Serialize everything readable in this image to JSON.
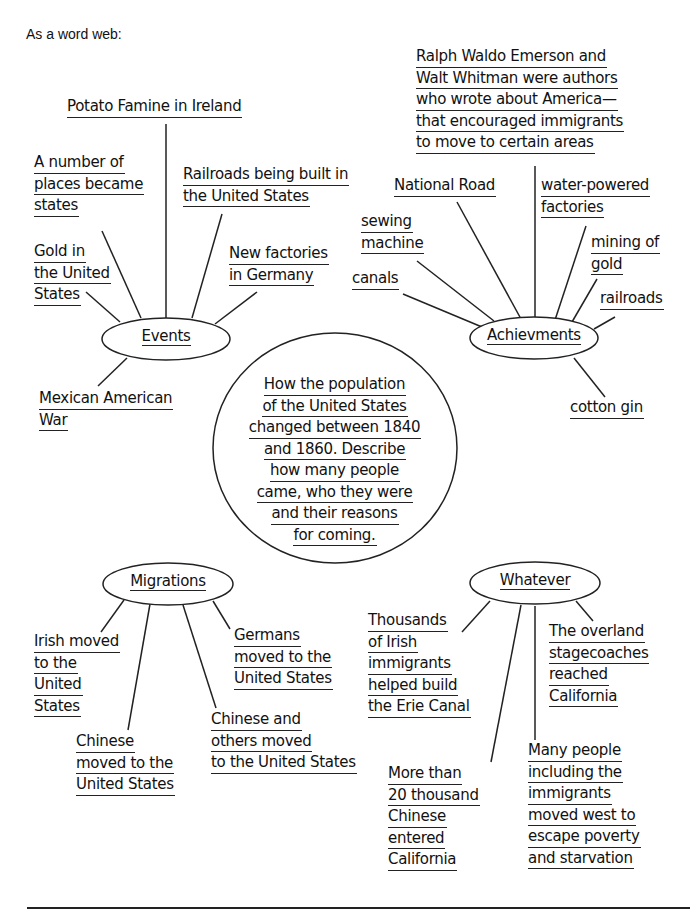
{
  "intro": "As a word web:",
  "center": {
    "lines": [
      "How the population",
      "of the United States",
      "changed between 1840",
      "and 1860. Describe",
      "how many people",
      "came, who they were",
      "and their reasons",
      "for coming."
    ]
  },
  "nodes": {
    "events": {
      "label": "Events",
      "items": [
        {
          "lines": [
            "Potato Famine in Ireland"
          ]
        },
        {
          "lines": [
            "A number of",
            "places became",
            "states"
          ]
        },
        {
          "lines": [
            "Railroads being built in",
            "the United States"
          ]
        },
        {
          "lines": [
            "Gold in",
            "the United",
            "States"
          ]
        },
        {
          "lines": [
            "New factories",
            "in Germany"
          ]
        },
        {
          "lines": [
            "Mexican American",
            "War"
          ]
        }
      ]
    },
    "achievements": {
      "label": "Achievments",
      "items": [
        {
          "lines": [
            "Ralph Waldo Emerson and",
            "Walt Whitman were authors",
            "who wrote about America—",
            "that encouraged immigrants",
            "to move to certain areas"
          ]
        },
        {
          "lines": [
            "National Road"
          ]
        },
        {
          "lines": [
            "water-powered",
            "factories"
          ]
        },
        {
          "lines": [
            "sewing",
            "machine"
          ]
        },
        {
          "lines": [
            "mining of",
            "gold"
          ]
        },
        {
          "lines": [
            "canals"
          ]
        },
        {
          "lines": [
            "railroads"
          ]
        },
        {
          "lines": [
            "cotton gin"
          ]
        }
      ]
    },
    "migrations": {
      "label": "Migrations",
      "items": [
        {
          "lines": [
            "Irish moved",
            "to the",
            "United",
            "States"
          ]
        },
        {
          "lines": [
            "Germans",
            "moved to the",
            "United States"
          ]
        },
        {
          "lines": [
            "Chinese and",
            "others moved",
            "to the United States"
          ]
        },
        {
          "lines": [
            "Chinese",
            "moved to the",
            "United States"
          ]
        }
      ]
    },
    "whatever": {
      "label": "Whatever",
      "items": [
        {
          "lines": [
            "Thousands",
            "of Irish",
            "immigrants",
            "helped build",
            "the Erie Canal"
          ]
        },
        {
          "lines": [
            "The overland",
            "stagecoaches",
            "reached",
            "California"
          ]
        },
        {
          "lines": [
            "More than",
            "20 thousand",
            "Chinese",
            "entered",
            "California"
          ]
        },
        {
          "lines": [
            "Many people",
            "including the",
            "immigrants",
            "moved west to",
            "escape poverty",
            "and starvation"
          ]
        }
      ]
    }
  }
}
